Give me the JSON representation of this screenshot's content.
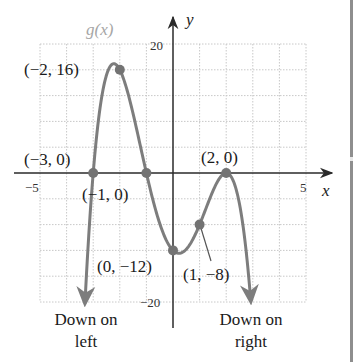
{
  "chart_data": {
    "type": "line",
    "title": "",
    "function_label": "g(x)",
    "function": "g(x) = -(x+3)(x+1)(x-2)^2",
    "xlabel": "x",
    "ylabel": "y",
    "xlim": [
      -5,
      5
    ],
    "ylim": [
      -20,
      20
    ],
    "grid": true,
    "grid_step": {
      "x": 1,
      "y": 4
    },
    "x_tick_labels": [
      {
        "value": -5,
        "label": "−5"
      },
      {
        "value": 5,
        "label": "5"
      }
    ],
    "y_tick_labels": [
      {
        "value": 20,
        "label": "20"
      },
      {
        "value": -20,
        "label": "−20"
      }
    ],
    "series": [
      {
        "name": "g(x)",
        "x": [
          -3.31,
          -3.0,
          -2.75,
          -2.5,
          -2.25,
          -2.0,
          -1.75,
          -1.5,
          -1.25,
          -1.0,
          -0.5,
          0.0,
          0.25,
          0.5,
          1.0,
          1.5,
          2.0,
          2.25,
          2.5,
          2.75,
          2.925
        ],
        "y": [
          -20,
          0,
          9.87,
          15.19,
          16.93,
          16,
          13.18,
          9.19,
          4.62,
          0,
          -7.81,
          -12,
          -12.44,
          -11.81,
          -8,
          -2.81,
          0,
          -1.07,
          -4.81,
          -12.13,
          -20
        ]
      }
    ],
    "labeled_points": [
      {
        "x": -2,
        "y": 16,
        "label": "(−2, 16)"
      },
      {
        "x": -3,
        "y": 0,
        "label": "(−3, 0)"
      },
      {
        "x": -1,
        "y": 0,
        "label": "(−1, 0)"
      },
      {
        "x": 2,
        "y": 0,
        "label": "(2, 0)"
      },
      {
        "x": 0,
        "y": -12,
        "label": "(0, −12)"
      },
      {
        "x": 1,
        "y": -8,
        "label": "(1, −8)"
      }
    ],
    "annotations": [
      {
        "text": [
          "Down on",
          "left"
        ],
        "position": "bottom-left"
      },
      {
        "text": [
          "Down on",
          "right"
        ],
        "position": "bottom-right"
      }
    ],
    "colors": {
      "curve": "#7d7d7d",
      "points": "#737373",
      "axes": "#2a2a2a",
      "grid": "#c8c8c8",
      "function_label": "#a6a6a6"
    }
  },
  "labels": {
    "fname": "g(x)",
    "y_axis": "y",
    "x_axis": "x",
    "tick_x_neg5": "−5",
    "tick_x_5": "5",
    "tick_y_20": "20",
    "tick_y_neg20": "−20",
    "pt_max": "(−2, 16)",
    "pt_root_a": "(−3, 0)",
    "pt_root_b": "(−1, 0)",
    "pt_root_c": "(2, 0)",
    "pt_yint": "(0, −12)",
    "pt_one": "(1, −8)",
    "left_note_1": "Down on",
    "left_note_2": "left",
    "right_note_1": "Down on",
    "right_note_2": "right"
  }
}
